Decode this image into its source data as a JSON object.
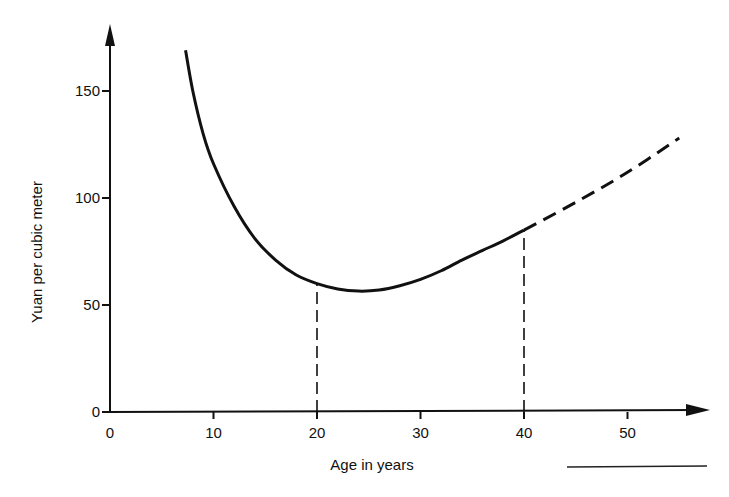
{
  "chart_data": {
    "type": "line",
    "title": "",
    "xlabel": "Age in years",
    "ylabel": "Yuan per cubic meter",
    "xlim": [
      0,
      57
    ],
    "ylim": [
      0,
      175
    ],
    "x_ticks": [
      0,
      10,
      20,
      30,
      40,
      50
    ],
    "y_ticks": [
      0,
      50,
      100,
      150
    ],
    "grid": false,
    "legend": null,
    "series": [
      {
        "name": "Cost curve (solid)",
        "style": "solid",
        "x": [
          7.3,
          8,
          9,
          10,
          12,
          14,
          16,
          18,
          20,
          22,
          24,
          26,
          28,
          30,
          32,
          34,
          36,
          38,
          40
        ],
        "y": [
          169,
          150,
          130,
          116,
          96,
          81,
          71,
          64,
          60,
          57.5,
          56.5,
          57,
          59,
          62,
          66,
          71,
          75.5,
          80,
          85
        ]
      },
      {
        "name": "Extrapolation (dashed)",
        "style": "dashed",
        "x": [
          40,
          45,
          50,
          55
        ],
        "y": [
          85,
          98,
          112,
          128
        ]
      }
    ],
    "annotations": [
      {
        "type": "vertical-dashed-line",
        "x": 20,
        "y_from": 0,
        "y_to": 60
      },
      {
        "type": "vertical-dashed-line",
        "x": 40,
        "y_from": 0,
        "y_to": 85
      }
    ],
    "minimum": {
      "x": 24.5,
      "y": 56.5
    }
  },
  "axes": {
    "x_title": "Age in years",
    "y_title": "Yuan per cubic meter",
    "x_tick_labels": [
      "0",
      "10",
      "20",
      "30",
      "40",
      "50"
    ],
    "y_tick_labels": [
      "0",
      "50",
      "100",
      "150"
    ]
  }
}
